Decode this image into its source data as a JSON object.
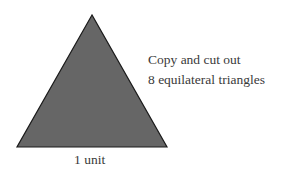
{
  "diagram": {
    "shape": "equilateral-triangle",
    "fill_color": "#666666",
    "stroke_color": "#1a1a1a",
    "side_label": "1 unit",
    "instructions": {
      "line1": "Copy and cut out",
      "line2": "8 equilateral triangles"
    }
  }
}
